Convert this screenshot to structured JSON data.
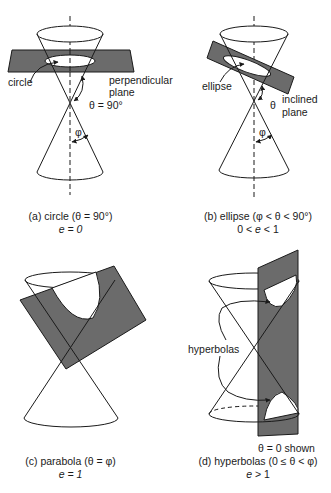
{
  "figure": {
    "colors": {
      "plane_fill": "#6b6b6b",
      "line": "#1a1a1a",
      "background": "#ffffff"
    },
    "panels": [
      {
        "id": "a",
        "labels": {
          "curve": "circle",
          "plane_line1": "perpendicular",
          "plane_line2": "plane",
          "theta": "θ = 90°",
          "phi": "φ"
        },
        "caption_line1": "(a) circle (θ = 90°)",
        "caption_line2": "e = 0"
      },
      {
        "id": "b",
        "labels": {
          "curve": "ellipse",
          "theta": "θ",
          "plane_line1": "inclined",
          "plane_line2": "plane",
          "phi": "φ"
        },
        "caption_line1": "(b) ellipse (φ < θ < 90°)",
        "caption_line2": "0 < e < 1"
      },
      {
        "id": "c",
        "labels": {},
        "caption_line1": "(c) parabola (θ = φ)",
        "caption_line2": "e = 1"
      },
      {
        "id": "d",
        "labels": {
          "curve": "hyperbolas",
          "note": "θ = 0 shown"
        },
        "caption_line1": "(d) hyperbolas (0 ≤ θ < φ)",
        "caption_line2": "e > 1"
      }
    ]
  }
}
